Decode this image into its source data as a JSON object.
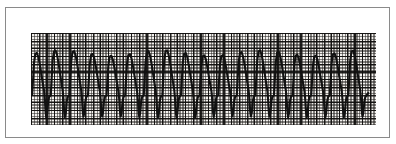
{
  "figure": {
    "type": "ecg-rhythm-strip",
    "caption": "",
    "frame_color": "#8a8a8a",
    "page_background": "#ffffff"
  },
  "strip": {
    "paper_color": "#f3f1ee",
    "fine_grid_color": "#282624",
    "major_grid_color": "#0f0e0d",
    "trace_color": "#111111",
    "fine_grid_mm_px": 1.54,
    "major_grid_mm_px": 7.7,
    "small_boxes_per_large": 5,
    "lead_label": "",
    "speed_label": "",
    "gain_label": ""
  },
  "chart_data": {
    "type": "line",
    "title": "",
    "subtitle": "",
    "xlabel": "",
    "ylabel": "",
    "legend": [],
    "grid": true,
    "legend_position": "none",
    "xlim": [
      0,
      345
    ],
    "ylim": [
      0,
      92
    ],
    "rhythm": "monomorphic wide-complex tachycardia",
    "beat_count": 18,
    "beat_interval_px": 18.6,
    "baseline_y_px": 70,
    "peak_y_px": 20,
    "trough_y_px": 84,
    "series": [
      {
        "name": "ECG lead trace",
        "points": [
          [
            0,
            70
          ],
          [
            1.5,
            40
          ],
          [
            2.6,
            84
          ],
          [
            4.2,
            70
          ],
          [
            6.0,
            62
          ],
          [
            7.4,
            30
          ],
          [
            8.6,
            21
          ],
          [
            10.0,
            20
          ],
          [
            11.4,
            24
          ],
          [
            13.0,
            33
          ],
          [
            14.6,
            44
          ],
          [
            15.8,
            52
          ],
          [
            16.8,
            57
          ],
          [
            17.6,
            66
          ],
          [
            18.2,
            78
          ],
          [
            18.8,
            84
          ],
          [
            19.6,
            80
          ],
          [
            20.4,
            68
          ],
          [
            24.6,
            62
          ],
          [
            26.0,
            30
          ],
          [
            27.2,
            21
          ],
          [
            28.6,
            20
          ],
          [
            30.0,
            24
          ],
          [
            31.6,
            33
          ],
          [
            33.2,
            44
          ],
          [
            34.4,
            52
          ],
          [
            35.4,
            57
          ],
          [
            36.2,
            66
          ],
          [
            36.8,
            78
          ],
          [
            37.4,
            84
          ],
          [
            38.2,
            80
          ],
          [
            39.0,
            68
          ],
          [
            43.2,
            62
          ],
          [
            44.6,
            30
          ],
          [
            45.8,
            21
          ],
          [
            47.2,
            20
          ],
          [
            48.6,
            24
          ],
          [
            50.2,
            33
          ],
          [
            51.8,
            44
          ],
          [
            53.0,
            52
          ],
          [
            54.0,
            57
          ],
          [
            54.8,
            66
          ],
          [
            55.4,
            78
          ],
          [
            56.0,
            84
          ],
          [
            56.8,
            80
          ],
          [
            57.6,
            68
          ]
        ],
        "note": "pattern repeats at a fixed interval across the strip"
      }
    ]
  }
}
